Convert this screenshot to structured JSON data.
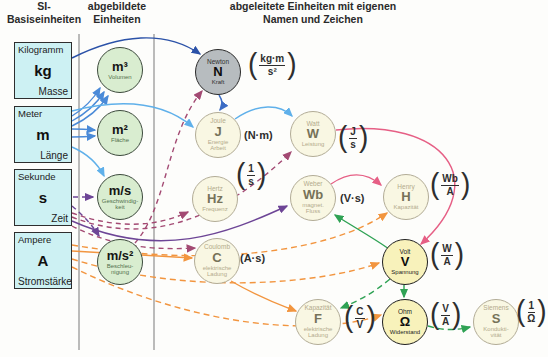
{
  "headers": {
    "col_base": "SI-\nBasiseinheiten",
    "col_mapped": "abgebildete\nEinheiten",
    "col_derived": "abgeleitete Einheiten mit eigenen\nNamen und Zeichen"
  },
  "base_units": [
    {
      "name": "Kilogramm",
      "symbol": "kg",
      "quantity": "Masse"
    },
    {
      "name": "Meter",
      "symbol": "m",
      "quantity": "Länge"
    },
    {
      "name": "Sekunde",
      "symbol": "s",
      "quantity": "Zeit"
    },
    {
      "name": "Ampere",
      "symbol": "A",
      "quantity": "Stromstärke"
    }
  ],
  "mapped_units": [
    {
      "symbol": "m³",
      "quantity": "Volumen"
    },
    {
      "symbol": "m²",
      "quantity": "Fläche"
    },
    {
      "symbol": "m/s",
      "quantity": "Geschwindig-\nkeit"
    },
    {
      "symbol": "m/s²",
      "quantity": "Beschleu-\nnigung"
    }
  ],
  "derived_units": [
    {
      "name": "Newton",
      "symbol": "N",
      "quantity": "Kraft",
      "num": "kg·m",
      "den": "s²"
    },
    {
      "name": "Joule",
      "symbol": "J",
      "quantity": "Energie\nArbeit",
      "inline": "(N·m)"
    },
    {
      "name": "Watt",
      "symbol": "W",
      "quantity": "Leistung",
      "num": "J",
      "den": "s"
    },
    {
      "name": "Hertz",
      "symbol": "Hz",
      "quantity": "Frequenz",
      "num": "1",
      "den": "s"
    },
    {
      "name": "Weber",
      "symbol": "Wb",
      "quantity": "magnet.\nFluss",
      "inline": "(V·s)"
    },
    {
      "name": "Henry",
      "symbol": "H",
      "quantity": "Kapazität",
      "num": "Wb",
      "den": "A"
    },
    {
      "name": "Coulomb",
      "symbol": "C",
      "quantity": "elektrische\nLadung",
      "inline": "(A·s)"
    },
    {
      "name": "Volt",
      "symbol": "V",
      "quantity": "Spannung",
      "num": "W",
      "den": "A"
    },
    {
      "name": "Kapazität",
      "symbol": "F",
      "quantity": "elektrische\nLadung",
      "num": "C",
      "den": "V"
    },
    {
      "name": "Ohm",
      "symbol": "Ω",
      "quantity": "Widerstand",
      "num": "V",
      "den": "A"
    },
    {
      "name": "Siemens",
      "symbol": "S",
      "quantity": "Kondukti-\nvität",
      "num": "1",
      "den": "Ω"
    }
  ],
  "paren_open": "(",
  "paren_close": ")",
  "arrow_colors": {
    "kilogramm": "#2b52a8",
    "meter_blue": "#4a8ad8",
    "meter_light": "#5fb0ea",
    "sekunde_violet": "#6d4596",
    "sekunde_maroon": "#a34a73",
    "ampere_orange": "#f2953f",
    "watt_weber_pink": "#e65f85",
    "volt_green": "#2fa254"
  }
}
